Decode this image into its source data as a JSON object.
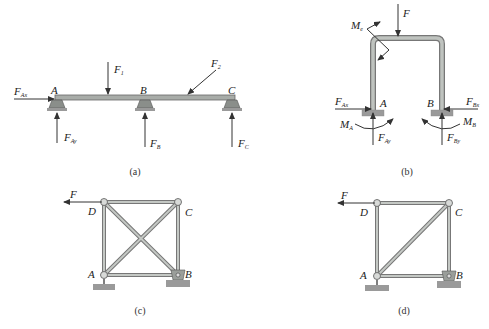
{
  "figures": [
    {
      "id": "a",
      "caption": "(a)",
      "type": "beam",
      "points": [
        "A",
        "B",
        "C"
      ],
      "forces": [
        {
          "name": "F",
          "sub": "Ax"
        },
        {
          "name": "F",
          "sub": "Ay"
        },
        {
          "name": "F",
          "sub": "1"
        },
        {
          "name": "F",
          "sub": "B"
        },
        {
          "name": "F",
          "sub": "2"
        },
        {
          "name": "F",
          "sub": "C"
        }
      ]
    },
    {
      "id": "b",
      "caption": "(b)",
      "type": "portal-frame",
      "points": [
        "A",
        "B"
      ],
      "forces": [
        {
          "name": "F",
          "sub": ""
        },
        {
          "name": "M",
          "sub": "e"
        },
        {
          "name": "F",
          "sub": "Ax"
        },
        {
          "name": "F",
          "sub": "Ay"
        },
        {
          "name": "M",
          "sub": "A"
        },
        {
          "name": "F",
          "sub": "Bx"
        },
        {
          "name": "F",
          "sub": "By"
        },
        {
          "name": "M",
          "sub": "B"
        }
      ]
    },
    {
      "id": "c",
      "caption": "(c)",
      "type": "truss-double-diagonal",
      "points": [
        "A",
        "B",
        "C",
        "D"
      ],
      "forces": [
        {
          "name": "F",
          "sub": ""
        }
      ]
    },
    {
      "id": "d",
      "caption": "(d)",
      "type": "truss-single-diagonal",
      "points": [
        "A",
        "B",
        "C",
        "D"
      ],
      "forces": [
        {
          "name": "F",
          "sub": ""
        }
      ]
    }
  ]
}
